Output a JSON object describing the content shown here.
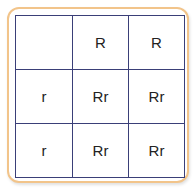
{
  "colors": {
    "frame": "#f2c48a",
    "grid": "#3a3f78",
    "text": "#222222"
  },
  "header_row": [
    "",
    "R",
    "R"
  ],
  "rows": [
    {
      "label": "r",
      "cells": [
        "Rr",
        "Rr"
      ]
    },
    {
      "label": "r",
      "cells": [
        "Rr",
        "Rr"
      ]
    }
  ]
}
